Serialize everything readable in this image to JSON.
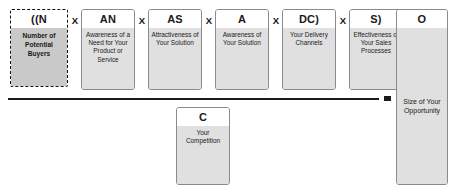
{
  "diagram": {
    "operator_multiply": "X",
    "operator_equals": "=",
    "colors": {
      "box_border": "#8a8a8a",
      "box_header_bg": "#ffffff",
      "box_body_bg": "#e0e0e0",
      "highlight_box_bg": "#c9c9c9",
      "highlight_box_border": "#111111",
      "rule_color": "#1a1a1a",
      "text_color": "#1a1a1a"
    },
    "numerator": [
      {
        "code": "((N",
        "description": "Number of Potential Buyers",
        "highlighted": true
      },
      {
        "code": "AN",
        "description": "Awareness of a Need for Your Product or Service",
        "highlighted": false
      },
      {
        "code": "AS",
        "description": "Attractiveness of Your Solution",
        "highlighted": false
      },
      {
        "code": "A",
        "description": "Awareness of Your Solution",
        "highlighted": false
      },
      {
        "code": "DC)",
        "description": "Your Delivery Channels",
        "highlighted": false
      },
      {
        "code": "S)",
        "description": "Effectiveness of Your Sales Processes",
        "highlighted": false
      }
    ],
    "denominator": {
      "code": "C",
      "description": "Your Competition"
    },
    "result": {
      "code": "O",
      "description": "Size of Your Opportunity"
    }
  }
}
